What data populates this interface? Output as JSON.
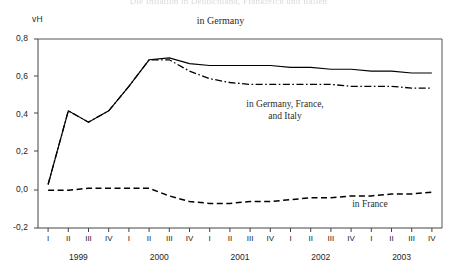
{
  "figure": {
    "title_cropped": "Die Inflation in Deutschland, Frankreich und Italien",
    "y_unit_label": "vH",
    "top_series_label": "in Germany"
  },
  "annotations": {
    "middle": "in Germany, France,\nand Italy",
    "france": "in France"
  },
  "axis": {
    "y_ticks": [
      "0,8",
      "0,6",
      "0,4",
      "0,2",
      "0,0",
      "-0,2"
    ],
    "quarters": [
      "I",
      "II",
      "III",
      "IV",
      "I",
      "II",
      "III",
      "IV",
      "I",
      "II",
      "III",
      "IV",
      "I",
      "II",
      "III",
      "IV",
      "I",
      "II",
      "III",
      "IV"
    ],
    "years": [
      "1999",
      "2000",
      "2001",
      "2002",
      "2003"
    ]
  },
  "chart_data": {
    "type": "line",
    "title": "Die Inflation in Deutschland, Frankreich und Italien",
    "xlabel": "",
    "ylabel": "vH",
    "ylim": [
      -0.2,
      0.8
    ],
    "yticks": [
      -0.2,
      0.0,
      0.2,
      0.4,
      0.6,
      0.8
    ],
    "grid": false,
    "legend": "inline-annotations",
    "x": [
      "1999 I",
      "1999 II",
      "1999 III",
      "1999 IV",
      "2000 I",
      "2000 II",
      "2000 III",
      "2000 IV",
      "2001 I",
      "2001 II",
      "2001 III",
      "2001 IV",
      "2002 I",
      "2002 II",
      "2002 III",
      "2002 IV",
      "2003 I",
      "2003 II",
      "2003 III",
      "2003 IV"
    ],
    "series": [
      {
        "name": "in Germany",
        "style": "solid",
        "color": "#000000",
        "values": [
          0.03,
          0.42,
          0.36,
          0.42,
          0.55,
          0.69,
          0.7,
          0.67,
          0.66,
          0.66,
          0.66,
          0.66,
          0.65,
          0.65,
          0.64,
          0.64,
          0.63,
          0.63,
          0.62,
          0.62
        ]
      },
      {
        "name": "in Germany, France, and Italy",
        "style": "dash-dot",
        "color": "#000000",
        "values": [
          0.03,
          0.42,
          0.36,
          0.42,
          0.55,
          0.69,
          0.69,
          0.63,
          0.59,
          0.57,
          0.56,
          0.56,
          0.56,
          0.56,
          0.56,
          0.55,
          0.55,
          0.55,
          0.54,
          0.54
        ]
      },
      {
        "name": "in France",
        "style": "dashed",
        "color": "#000000",
        "values": [
          0.0,
          0.0,
          0.01,
          0.01,
          0.01,
          0.01,
          -0.03,
          -0.06,
          -0.07,
          -0.07,
          -0.06,
          -0.06,
          -0.05,
          -0.04,
          -0.04,
          -0.03,
          -0.03,
          -0.02,
          -0.02,
          -0.01
        ]
      }
    ]
  }
}
